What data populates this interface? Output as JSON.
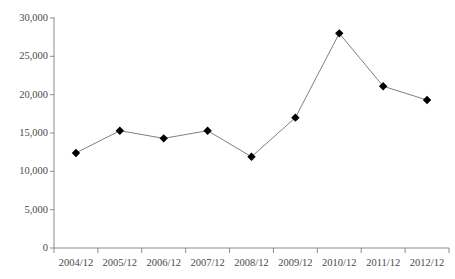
{
  "chart_data": {
    "type": "line",
    "title": "",
    "title_clipped": true,
    "xlabel": "",
    "ylabel": "",
    "categories": [
      "2004/12",
      "2005/12",
      "2006/12",
      "2007/12",
      "2008/12",
      "2009/12",
      "2010/12",
      "2011/12",
      "2012/12"
    ],
    "values": [
      12400,
      15300,
      14300,
      15300,
      11900,
      17000,
      28000,
      21100,
      19300
    ],
    "ylim": [
      0,
      30000
    ],
    "ytick_values": [
      0,
      5000,
      10000,
      15000,
      20000,
      25000,
      30000
    ],
    "ytick_labels": [
      "0",
      "5,000",
      "10,000",
      "15,000",
      "20,000",
      "25,000",
      "30,000"
    ],
    "grid": false,
    "legend": false,
    "legend_position": "none",
    "marker": "diamond",
    "marker_color": "#000000",
    "line_color": "#808080",
    "axis_color": "#808080",
    "background_color": "#ffffff"
  },
  "axes": {
    "y_labels": [
      "30,000",
      "25,000",
      "20,000",
      "15,000",
      "10,000",
      "5,000",
      "0"
    ],
    "x_labels": [
      "2004/12",
      "2005/12",
      "2006/12",
      "2007/12",
      "2008/12",
      "2009/12",
      "2010/12",
      "2011/12",
      "2012/12"
    ]
  },
  "header": {
    "clipped_title": ""
  }
}
